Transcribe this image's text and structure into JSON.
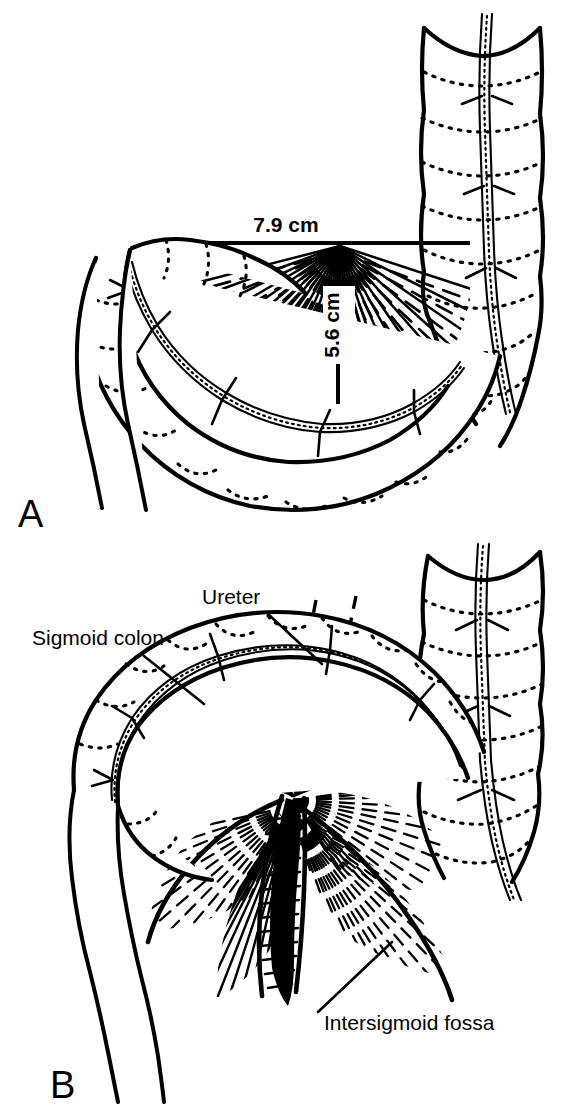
{
  "figure": {
    "background_color": "#ffffff",
    "ink_color": "#000000",
    "style": "black-and-white anatomical line drawing"
  },
  "panels": [
    {
      "id": "A",
      "letter": "A",
      "description": "Sigmoid colon loop with sigmoid mesocolon shown as a radiating fan; mesenteric root dimensions annotated",
      "measurements": [
        {
          "name": "mesocolon-width",
          "label": "7.9 cm",
          "orientation": "horizontal",
          "position": "above mesenteric root line"
        },
        {
          "name": "mesocolon-height",
          "label": "5.6 cm",
          "orientation": "vertical-rotated",
          "position": "center of mesenteric fan"
        }
      ]
    },
    {
      "id": "B",
      "letter": "B",
      "description": "Sigmoid colon lifted to expose the intersigmoid fossa; ureter shown passing deep to the mesocolon",
      "callouts": [
        {
          "name": "sigmoid-colon",
          "label": "Sigmoid colon",
          "leader": "down-right to colon wall"
        },
        {
          "name": "ureter",
          "label": "Ureter",
          "leader": "down-right to dashed ureter lines"
        },
        {
          "name": "intersigmoid-fossa",
          "label": "Intersigmoid fossa",
          "leader": "up-left to fossa recess"
        }
      ]
    }
  ],
  "structures": [
    {
      "name": "descending-colon",
      "rendering": "haustrated tube, upper right"
    },
    {
      "name": "sigmoid-colon",
      "rendering": "haustrated loop"
    },
    {
      "name": "rectum",
      "rendering": "smooth tapering tube, lower left"
    },
    {
      "name": "sigmoid-mesocolon",
      "rendering": "fan of radiating hatch strokes"
    },
    {
      "name": "taenia-coli",
      "rendering": "longitudinal band with dotted margins"
    },
    {
      "name": "mesenteric-vessels",
      "rendering": "branching thin lines within mesocolon"
    },
    {
      "name": "ureter",
      "rendering": "pair of parallel dashed lines"
    },
    {
      "name": "intersigmoid-fossa",
      "rendering": "dark slit-like recess with converging hatching"
    }
  ]
}
